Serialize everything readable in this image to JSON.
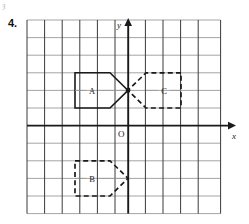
{
  "exercise": {
    "number": "4.",
    "artifact_mark": "ȝ"
  },
  "figure": {
    "type": "coordinate-grid-transformation",
    "grid": {
      "columns": 11,
      "rows": 11,
      "cell_px": 17.6,
      "left_px": 27,
      "top_px": 20,
      "line_color_vertical": "#3a3a3a",
      "line_color_horizontal": "#9a9a9a",
      "background": "#ffffff"
    },
    "axes": {
      "x_label": "x",
      "y_label": "y",
      "origin_label": "O",
      "color": "#1a1a1a",
      "x_axis_y_px": 125,
      "y_axis_x_px": 128
    },
    "center_point": {
      "name": "rotation-center",
      "x_px": 128,
      "y_px": 90
    },
    "shapes": [
      {
        "id": "A",
        "label": "A",
        "style": "solid",
        "color": "#1a1a1a",
        "orientation": "points-right",
        "label_x_px": 92,
        "label_y_px": 93,
        "points": "75,72 110,72 128,90 110,107 75,107"
      },
      {
        "id": "C",
        "label": "C",
        "style": "dashed",
        "color": "#1a1a1a",
        "orientation": "points-left",
        "label_x_px": 164,
        "label_y_px": 93,
        "points": "181,72 146,72 128,90 146,107 181,107"
      },
      {
        "id": "B",
        "label": "B",
        "style": "dashed",
        "color": "#1a1a1a",
        "orientation": "points-right",
        "label_x_px": 92,
        "label_y_px": 180,
        "points": "75,160 110,160 128,177 110,195 75,195"
      }
    ]
  }
}
